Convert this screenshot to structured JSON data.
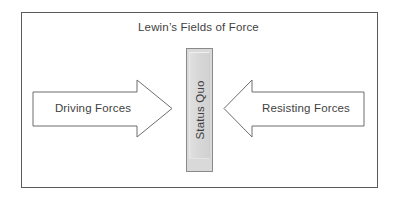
{
  "diagram": {
    "title": "Lewin’s Fields of Force",
    "background_color": "#ffffff",
    "frame_color": "#5a5a5a",
    "text_color": "#3f3f3f",
    "left_arrow": {
      "label": "Driving Forces",
      "direction": "right",
      "fill_color": "#ffffff",
      "stroke_color": "#6d6d6d"
    },
    "center_bar": {
      "label": "Status Quo",
      "orientation": "vertical-rotated",
      "fill_color": "#d9d9d9",
      "stroke_color": "#8a8a8a"
    },
    "right_arrow": {
      "label": "Resisting Forces",
      "direction": "left",
      "fill_color": "#ffffff",
      "stroke_color": "#6d6d6d"
    }
  }
}
